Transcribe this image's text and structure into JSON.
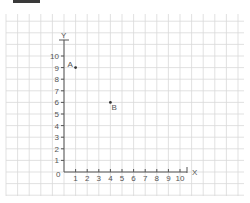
{
  "header": {
    "bar_color": "#3a3a3a"
  },
  "chart_data": {
    "type": "scatter",
    "title": "",
    "xlabel": "X",
    "ylabel": "Y",
    "origin_label": "0",
    "xlim": [
      0,
      10
    ],
    "ylim": [
      0,
      10
    ],
    "x_ticks": [
      "1",
      "2",
      "3",
      "4",
      "5",
      "6",
      "7",
      "8",
      "9",
      "10"
    ],
    "y_ticks": [
      "1",
      "2",
      "3",
      "4",
      "5",
      "6",
      "7",
      "8",
      "9",
      "10"
    ],
    "grid": true,
    "points": [
      {
        "label": "A",
        "x": 1,
        "y": 9
      },
      {
        "label": "B",
        "x": 4,
        "y": 6
      }
    ]
  },
  "colors": {
    "grid": "#d9d9d9",
    "axis": "#555555",
    "point": "#333333"
  }
}
